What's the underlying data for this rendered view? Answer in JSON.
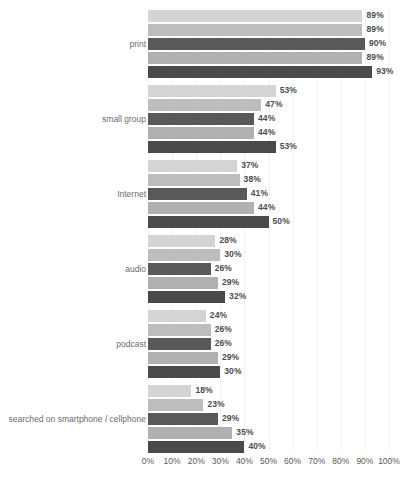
{
  "chart_data": {
    "type": "bar",
    "orientation": "horizontal",
    "title": "",
    "subtitle": "",
    "xlabel": "",
    "ylabel": "",
    "xlim": [
      0,
      100
    ],
    "xtick_labels": [
      "0%",
      "10%",
      "20%",
      "30%",
      "40%",
      "50%",
      "60%",
      "70%",
      "80%",
      "90%",
      "100%"
    ],
    "xtick_values": [
      0,
      10,
      20,
      30,
      40,
      50,
      60,
      70,
      80,
      90,
      100
    ],
    "grid": true,
    "grid_axis": "x",
    "legend": false,
    "legend_position": "none",
    "value_label_suffix": "%",
    "categories": [
      "print",
      "small group",
      "Internet",
      "audio",
      "podcast",
      "searched on smartphone / cellphone"
    ],
    "series": [
      {
        "name": "series-1",
        "color": "#d4d4d4",
        "values": [
          89,
          53,
          37,
          28,
          24,
          18
        ]
      },
      {
        "name": "series-2",
        "color": "#bdbdbd",
        "values": [
          89,
          47,
          38,
          30,
          26,
          23
        ]
      },
      {
        "name": "series-3",
        "color": "#595959",
        "values": [
          90,
          44,
          41,
          26,
          26,
          29
        ]
      },
      {
        "name": "series-4",
        "color": "#b0b0b0",
        "values": [
          89,
          44,
          44,
          29,
          29,
          35
        ]
      },
      {
        "name": "series-5",
        "color": "#4a4a4a",
        "values": [
          93,
          53,
          50,
          32,
          30,
          40
        ]
      }
    ],
    "value_labels": [
      [
        "89%",
        "89%",
        "90%",
        "89%",
        "93%"
      ],
      [
        "53%",
        "47%",
        "44%",
        "44%",
        "53%"
      ],
      [
        "37%",
        "38%",
        "41%",
        "44%",
        "50%"
      ],
      [
        "28%",
        "30%",
        "26%",
        "29%",
        "32%"
      ],
      [
        "24%",
        "26%",
        "26%",
        "29%",
        "30%"
      ],
      [
        "18%",
        "23%",
        "29%",
        "35%",
        "40%"
      ]
    ],
    "colors": {
      "bar_series_1": "#d4d4d4",
      "bar_series_2": "#bdbdbd",
      "bar_series_3": "#595959",
      "bar_series_4": "#b0b0b0",
      "bar_series_5": "#4a4a4a",
      "gridline": "#f2f2f2",
      "value_label": "#4d4d4d",
      "category_label": "#6b6b6b",
      "tick_label": "#595959",
      "background": "#ffffff"
    }
  }
}
